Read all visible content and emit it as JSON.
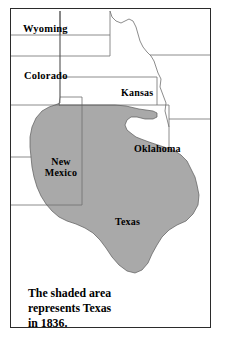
{
  "figure": {
    "caption": "The shaded area represents Texas in 1836.",
    "caption_lines": [
      "The shaded area",
      "represents Texas",
      "in 1836."
    ],
    "year": "1836"
  },
  "colors": {
    "shaded_area": "#a9a9a9",
    "shaded_outline": "#4d4d4d",
    "state_border": "#6e6e6e",
    "frame_border": "#2b2b2b",
    "background": "#ffffff",
    "label_text": "#000000"
  },
  "legend": {
    "shaded_meaning": "Texas in 1836"
  },
  "state_labels": [
    {
      "name": "wyoming",
      "label": "Wyoming"
    },
    {
      "name": "colorado",
      "label": "Colorado"
    },
    {
      "name": "kansas",
      "label": "Kansas"
    },
    {
      "name": "new-mexico",
      "label": "New"
    },
    {
      "name": "new-mexico2",
      "label": "Mexico"
    },
    {
      "name": "oklahoma",
      "label": "Oklahoma"
    },
    {
      "name": "texas",
      "label": "Texas"
    }
  ],
  "labels": {
    "wyoming": "Wyoming",
    "colorado": "Colorado",
    "kansas": "Kansas",
    "new_mexico_line1": "New",
    "new_mexico_line2": "Mexico",
    "oklahoma": "Oklahoma",
    "texas": "Texas"
  }
}
